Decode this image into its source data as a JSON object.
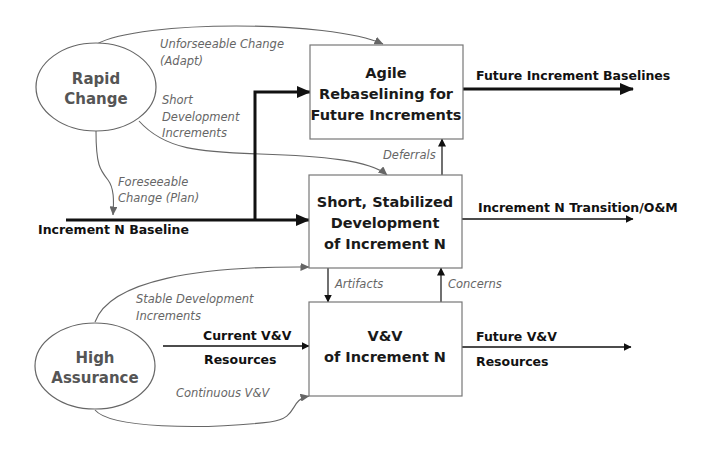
{
  "diagram": {
    "title": "",
    "nodes": {
      "rapid_change": {
        "line1": "Rapid",
        "line2": "Change"
      },
      "high_assurance": {
        "line1": "High",
        "line2": "Assurance"
      },
      "agile_rebaselining": {
        "line1": "Agile",
        "line2": "Rebaselining for",
        "line3": "Future Increments"
      },
      "short_stabilized": {
        "line1": "Short, Stabilized",
        "line2": "Development",
        "line3": "of Increment N"
      },
      "vv_increment": {
        "line1": "V&V",
        "line2": "of Increment N"
      }
    },
    "flows": {
      "increment_baseline": "Increment N Baseline",
      "future_baselines": "Future Increment Baselines",
      "transition_om": "Increment N Transition/O&M",
      "current_vv_line1": "Current V&V",
      "current_vv_line2": "Resources",
      "future_vv_line1": "Future V&V",
      "future_vv_line2": "Resources"
    },
    "influences": {
      "unforeseeable_line1": "Unforseeable Change",
      "unforeseeable_line2": "(Adapt)",
      "short_dev_line1": "Short",
      "short_dev_line2": "Development",
      "short_dev_line3": "Increments",
      "foreseeable_line1": "Foreseeable",
      "foreseeable_line2": "Change (Plan)",
      "deferrals": "Deferrals",
      "artifacts": "Artifacts",
      "concerns": "Concerns",
      "stable_line1": "Stable Development",
      "stable_line2": "Increments",
      "continuous_vv": "Continuous V&V"
    },
    "colors": {
      "box_stroke": "#777777",
      "thick_arrow": "#111111",
      "influence_arrow": "#666666",
      "italic_label": "#666666"
    }
  }
}
